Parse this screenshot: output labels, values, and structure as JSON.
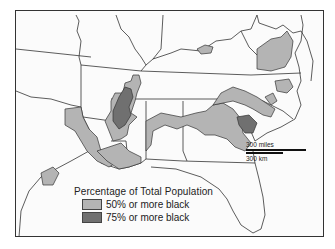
{
  "map": {
    "subject": "Southeastern United States",
    "colors": {
      "background": "#fbfbfb",
      "state_border": "#333333",
      "level_50": "#b4b4b4",
      "level_75": "#707070"
    }
  },
  "legend": {
    "title": "Percentage of Total Population",
    "items": [
      {
        "label": "50% or more black",
        "color": "#b4b4b4"
      },
      {
        "label": "75% or more black",
        "color": "#707070"
      }
    ]
  },
  "scale_bar": {
    "miles_label": "300 miles",
    "km_label": "300 km"
  }
}
